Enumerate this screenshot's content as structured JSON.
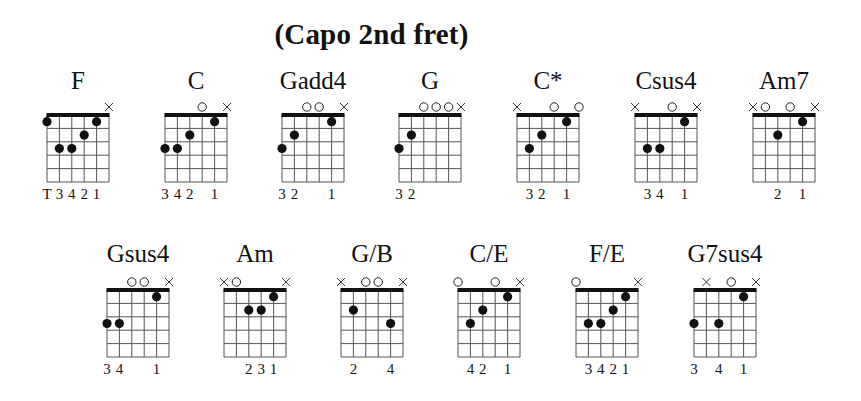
{
  "title": "(Capo 2nd fret)",
  "diagram": {
    "strings": 6,
    "frets": 5,
    "string_spacing": 12.4,
    "fret_spacing": 13.4,
    "line_color": "#555555",
    "nut_color": "#111111",
    "dot_color": "#111111"
  },
  "chords": [
    {
      "name": "F",
      "row": 0,
      "x": 47,
      "markers": {
        "6": "x"
      },
      "dots": [
        [
          1,
          1
        ],
        [
          2,
          3
        ],
        [
          3,
          3
        ],
        [
          4,
          2
        ],
        [
          5,
          1
        ]
      ],
      "fingers": [
        "T",
        "3",
        "4",
        "2",
        "1",
        ""
      ]
    },
    {
      "name": "C",
      "row": 0,
      "x": 165,
      "markers": {
        "4": "o",
        "6": "x"
      },
      "dots": [
        [
          1,
          3
        ],
        [
          2,
          3
        ],
        [
          3,
          2
        ],
        [
          5,
          1
        ]
      ],
      "fingers": [
        "3",
        "4",
        "2",
        "",
        "1",
        ""
      ]
    },
    {
      "name": "Gadd4",
      "row": 0,
      "x": 282,
      "markers": {
        "3": "o",
        "4": "o",
        "6": "x"
      },
      "dots": [
        [
          1,
          3
        ],
        [
          2,
          2
        ],
        [
          5,
          1
        ]
      ],
      "fingers": [
        "3",
        "2",
        "",
        "",
        "1",
        ""
      ]
    },
    {
      "name": "G",
      "row": 0,
      "x": 399,
      "markers": {
        "3": "o",
        "4": "o",
        "5": "o",
        "6": "x"
      },
      "dots": [
        [
          1,
          3
        ],
        [
          2,
          2
        ]
      ],
      "fingers": [
        "3",
        "2",
        "",
        "",
        "",
        ""
      ]
    },
    {
      "name": "C*",
      "row": 0,
      "x": 517,
      "markers": {
        "1": "x",
        "4": "o",
        "6": "o"
      },
      "dots": [
        [
          2,
          3
        ],
        [
          3,
          2
        ],
        [
          5,
          1
        ]
      ],
      "fingers": [
        "",
        "3",
        "2",
        "",
        "1",
        ""
      ]
    },
    {
      "name": "Csus4",
      "row": 0,
      "x": 635,
      "markers": {
        "1": "x",
        "4": "o",
        "6": "x"
      },
      "dots": [
        [
          2,
          3
        ],
        [
          3,
          3
        ],
        [
          5,
          1
        ]
      ],
      "fingers": [
        "",
        "3",
        "4",
        "",
        "1",
        ""
      ]
    },
    {
      "name": "Am7",
      "row": 0,
      "x": 753,
      "markers": {
        "1": "x",
        "2": "o",
        "4": "o",
        "6": "x"
      },
      "dots": [
        [
          3,
          2
        ],
        [
          5,
          1
        ]
      ],
      "fingers": [
        "",
        "",
        "2",
        "",
        "1",
        ""
      ]
    },
    {
      "name": "Gsus4",
      "row": 1,
      "x": 107,
      "markers": {
        "3": "o",
        "4": "o",
        "6": "x"
      },
      "dots": [
        [
          1,
          3
        ],
        [
          2,
          3
        ],
        [
          5,
          1
        ]
      ],
      "fingers": [
        "3",
        "4",
        "",
        "",
        "1",
        ""
      ]
    },
    {
      "name": "Am",
      "row": 1,
      "x": 224,
      "markers": {
        "1": "x",
        "2": "o",
        "6": "x"
      },
      "dots": [
        [
          3,
          2
        ],
        [
          4,
          2
        ],
        [
          5,
          1
        ]
      ],
      "fingers": [
        "",
        "",
        "2",
        "3",
        "1",
        ""
      ]
    },
    {
      "name": "G/B",
      "row": 1,
      "x": 341,
      "markers": {
        "1": "x",
        "3": "o",
        "4": "o",
        "6": "x"
      },
      "dots": [
        [
          2,
          2
        ],
        [
          5,
          3
        ]
      ],
      "fingers": [
        "",
        "2",
        "",
        "",
        "4",
        ""
      ]
    },
    {
      "name": "C/E",
      "row": 1,
      "x": 458,
      "markers": {
        "1": "o",
        "4": "o",
        "6": "x"
      },
      "dots": [
        [
          2,
          3
        ],
        [
          3,
          2
        ],
        [
          5,
          1
        ]
      ],
      "fingers": [
        "",
        "4",
        "2",
        "",
        "1",
        ""
      ]
    },
    {
      "name": "F/E",
      "row": 1,
      "x": 576,
      "markers": {
        "1": "o",
        "6": "x"
      },
      "dots": [
        [
          2,
          3
        ],
        [
          3,
          3
        ],
        [
          4,
          2
        ],
        [
          5,
          1
        ]
      ],
      "fingers": [
        "",
        "3",
        "4",
        "2",
        "1",
        ""
      ]
    },
    {
      "name": "G7sus4",
      "row": 1,
      "x": 694,
      "markers": {
        "2": "x",
        "4": "o",
        "6": "x"
      },
      "dots": [
        [
          1,
          3
        ],
        [
          3,
          3
        ],
        [
          5,
          1
        ]
      ],
      "fingers": [
        "3",
        "",
        "4",
        "",
        "1",
        ""
      ]
    }
  ],
  "rows": [
    {
      "name_top": 68,
      "nut_y": 115
    },
    {
      "name_top": 241,
      "nut_y": 290
    }
  ]
}
